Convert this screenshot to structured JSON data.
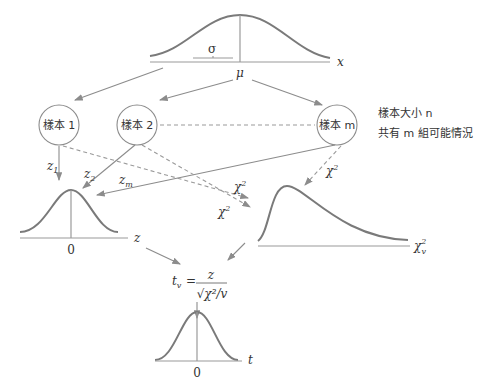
{
  "population": {
    "axis_label": "x",
    "mean_label": "μ",
    "sd_label": "σ"
  },
  "samples": [
    {
      "label": "樣本 1"
    },
    {
      "label": "樣本 2"
    },
    {
      "label": "樣本 m"
    }
  ],
  "notes": {
    "line1": "樣本大小 n",
    "line2": "共有 m 組可能情況"
  },
  "edges": {
    "z1": "z",
    "z1_sub": "1",
    "z2": "z",
    "z2_sub": "2",
    "zm": "z",
    "zm_sub": "m",
    "chi": "χ",
    "chi_sup": "2"
  },
  "z_dist": {
    "axis_label": "z",
    "center_label": "0"
  },
  "chi_dist": {
    "axis_label": "χ",
    "axis_sup": "2",
    "axis_sub": "v"
  },
  "formula": {
    "lhs": "t",
    "lhs_sub": "v",
    "eq": "=",
    "num": "z",
    "den": "√χ²/v"
  },
  "t_dist": {
    "axis_label": "t",
    "center_label": "0"
  }
}
